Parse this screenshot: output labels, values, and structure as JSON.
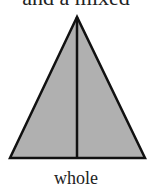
{
  "top_text": "and a mixed",
  "figure": {
    "shape": "triangle",
    "fill_color": "#b0b0b0",
    "stroke_color": "#111111",
    "label": "whole"
  }
}
